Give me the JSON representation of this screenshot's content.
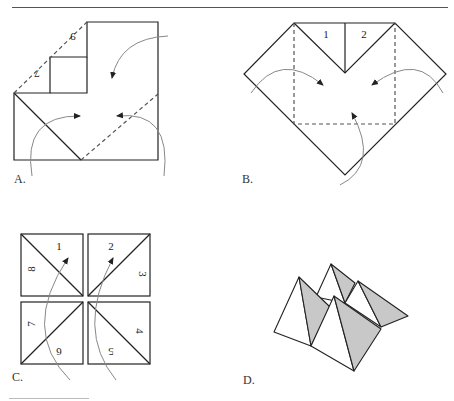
{
  "header": {
    "partial_text": "g"
  },
  "panels": {
    "a": {
      "label": "A.",
      "numbers": [
        "9",
        "7"
      ]
    },
    "b": {
      "label": "B.",
      "numbers": [
        "1",
        "2"
      ]
    },
    "c": {
      "label": "C.",
      "numbers": [
        "1",
        "2",
        "3",
        "4",
        "5",
        "6",
        "7",
        "8"
      ]
    },
    "d": {
      "label": "D."
    }
  },
  "colors": {
    "line": "#222222",
    "arrow": "#888888",
    "shade": "#c8c8c8",
    "rule": "#555555"
  }
}
